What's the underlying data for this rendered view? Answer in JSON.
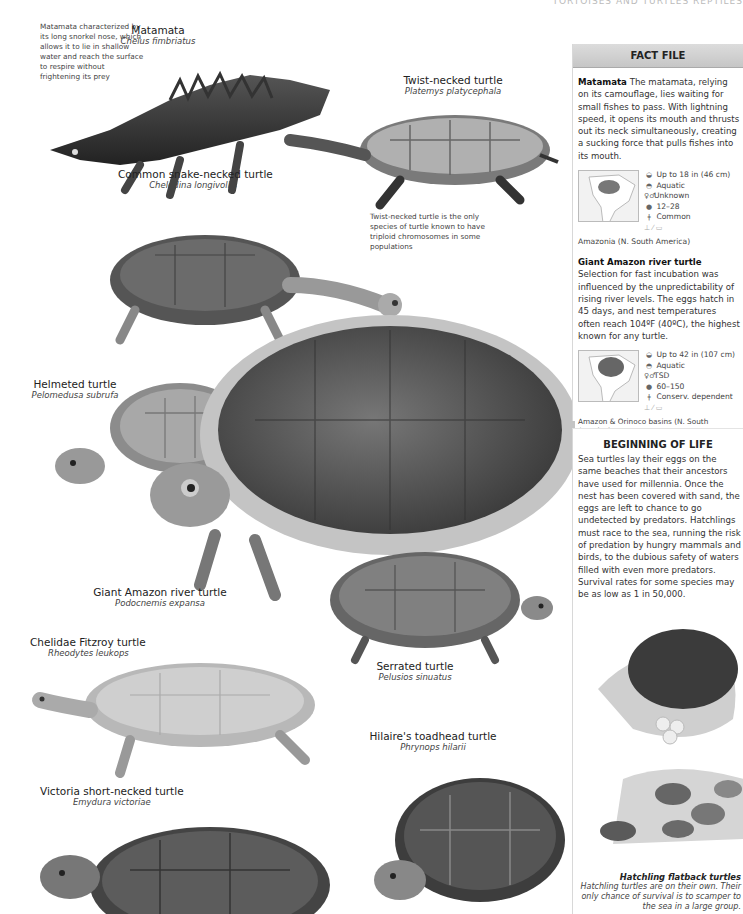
{
  "header": {
    "running_title": "TORTOISES AND TURTLES  REPTILES"
  },
  "species": [
    {
      "id": "matamata",
      "common": "Matamata",
      "scientific": "Chelus fimbriatus"
    },
    {
      "id": "twist-necked",
      "common": "Twist-necked turtle",
      "scientific": "Platemys platycephala"
    },
    {
      "id": "snake-necked",
      "common": "Common snake-necked turtle",
      "scientific": "Chelodina longivollis"
    },
    {
      "id": "helmeted",
      "common": "Helmeted turtle",
      "scientific": "Pelomedusa subrufa"
    },
    {
      "id": "giant-amazon",
      "common": "Giant Amazon river turtle",
      "scientific": "Podocnemis expansa"
    },
    {
      "id": "fitzroy",
      "common": "Chelidae Fitzroy turtle",
      "scientific": "Rheodytes leukops"
    },
    {
      "id": "serrated",
      "common": "Serrated turtle",
      "scientific": "Pelusios sinuatus"
    },
    {
      "id": "hilaire",
      "common": "Hilaire's toadhead turtle",
      "scientific": "Phrynops hilarii"
    },
    {
      "id": "victoria",
      "common": "Victoria short-necked turtle",
      "scientific": "Emydura victoriae"
    }
  ],
  "notes": {
    "matamata": "Matamata characterized by its long snorkel nose, which allows it to lie in shallow water and reach the surface to respire without frightening its prey",
    "twist_necked": "Twist-necked turtle is the only species of turtle known to have triploid chromosomes in some populations"
  },
  "fact_file": {
    "title": "FACT FILE",
    "entries": [
      {
        "name": "Matamata",
        "text": " The matamata, relying on its camouflage, lies waiting for small fishes to pass. With lightning speed, it opens its mouth and thrusts out its neck simultaneously, creating a sucking force that pulls fishes into its mouth.",
        "stats": {
          "size": "Up to 18 in (46 cm)",
          "habitat": "Aquatic",
          "sex": "Unknown",
          "eggs": "12–28",
          "status": "Common"
        },
        "range": "Amazonia (N. South America)"
      },
      {
        "name": "Giant Amazon river turtle",
        "text": " Selection for fast incubation was influenced by the unpredictability of rising river levels. The eggs hatch in 45 days, and nest temperatures often reach 104ºF (40ºC), the highest known for any turtle.",
        "stats": {
          "size": "Up to 42 in (107 cm)",
          "habitat": "Aquatic",
          "sex": "TSD",
          "eggs": "60–150",
          "status": "Conserv. dependent"
        },
        "range": "Amazon & Orinoco basins (N. South America)"
      }
    ]
  },
  "beginning_of_life": {
    "title": "BEGINNING OF LIFE",
    "text": "Sea turtles lay their eggs on the same beaches that their ancestors have used for millennia. Once the nest has been covered with sand, the eggs are left to chance to go undetected by predators. Hatchlings must race to the sea, running the risk of predation by hungry mammals and birds, to the dubious safety of waters filled with even more predators. Survival rates for some species may be as low as 1 in 50,000."
  },
  "hatchling_caption": {
    "title": "Hatchling flatback turtles",
    "text": "Hatchling turtles are on their own. Their only chance of survival is to scamper to the sea in a large group."
  }
}
